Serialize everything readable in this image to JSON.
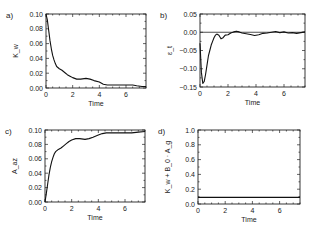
{
  "chart_data": [
    {
      "type": "line",
      "panel_label": "a)",
      "ylabel": "K_w",
      "xlabel": "Time",
      "xlim": [
        0,
        7.5
      ],
      "ylim": [
        0,
        0.1
      ],
      "xticks": [
        0,
        2,
        4,
        6
      ],
      "yticks": [
        0.0,
        0.02,
        0.04,
        0.06,
        0.08,
        0.1
      ],
      "ytick_labels": [
        "0.00",
        "0.02",
        "0.04",
        "0.06",
        "0.08",
        "0.10"
      ],
      "frame": {
        "x": 46,
        "y": 14,
        "w": 100,
        "h": 74
      },
      "series": [
        {
          "name": "K_w",
          "x": [
            0,
            0.1,
            0.2,
            0.3,
            0.4,
            0.5,
            0.6,
            0.7,
            0.8,
            1.0,
            1.2,
            1.4,
            1.6,
            1.8,
            2.0,
            2.3,
            2.6,
            3.0,
            3.3,
            3.6,
            4.0,
            4.3,
            4.6,
            5.0,
            5.5,
            6.0,
            6.5,
            6.8,
            7.2,
            7.5
          ],
          "y": [
            0.1,
            0.092,
            0.078,
            0.064,
            0.053,
            0.044,
            0.038,
            0.033,
            0.029,
            0.026,
            0.024,
            0.021,
            0.018,
            0.016,
            0.014,
            0.012,
            0.012,
            0.013,
            0.012,
            0.01,
            0.008,
            0.005,
            0.004,
            0.004,
            0.004,
            0.004,
            0.004,
            0.003,
            0.002,
            0.002
          ]
        }
      ]
    },
    {
      "type": "line",
      "panel_label": "b)",
      "ylabel": "ε_t",
      "xlabel": "Time",
      "xlim": [
        0,
        7.5
      ],
      "ylim": [
        -0.15,
        0.05
      ],
      "xticks": [
        0,
        2,
        4,
        6
      ],
      "yticks": [
        -0.15,
        -0.1,
        -0.05,
        0.0,
        0.05
      ],
      "ytick_labels": [
        "-0.15",
        "-0.10",
        "-0.05",
        "0.00",
        "0.05"
      ],
      "hline": 0.0,
      "frame": {
        "x": 200,
        "y": 14,
        "w": 105,
        "h": 73
      },
      "series": [
        {
          "name": "epsilon_t",
          "x": [
            0,
            0.1,
            0.2,
            0.3,
            0.4,
            0.5,
            0.6,
            0.7,
            0.8,
            0.9,
            1.0,
            1.1,
            1.2,
            1.35,
            1.5,
            1.65,
            1.8,
            2.0,
            2.2,
            2.4,
            2.6,
            2.8,
            3.0,
            3.3,
            3.6,
            3.9,
            4.2,
            4.5,
            4.8,
            5.1,
            5.4,
            5.7,
            6.0,
            6.3,
            6.6,
            6.9,
            7.2,
            7.5
          ],
          "y": [
            -0.03,
            -0.11,
            -0.14,
            -0.135,
            -0.115,
            -0.09,
            -0.065,
            -0.05,
            -0.035,
            -0.025,
            -0.015,
            -0.008,
            -0.005,
            -0.008,
            -0.018,
            -0.015,
            -0.008,
            -0.007,
            -0.002,
            0.001,
            0.003,
            0.001,
            -0.002,
            -0.004,
            -0.006,
            -0.009,
            -0.007,
            -0.003,
            -0.002,
            0.0,
            0.002,
            -0.001,
            0.001,
            -0.002,
            -0.001,
            -0.003,
            -0.001,
            0.001
          ]
        }
      ]
    },
    {
      "type": "line",
      "panel_label": "c)",
      "ylabel": "A_az",
      "xlabel": "Time",
      "xlim": [
        0,
        7.5
      ],
      "ylim": [
        0,
        0.1
      ],
      "xticks": [
        0,
        2,
        4,
        6
      ],
      "yticks": [
        0.0,
        0.02,
        0.04,
        0.06,
        0.08,
        0.1
      ],
      "ytick_labels": [
        "0.00",
        "0.02",
        "0.04",
        "0.06",
        "0.08",
        "0.10"
      ],
      "frame": {
        "x": 45,
        "y": 130,
        "w": 100,
        "h": 72
      },
      "series": [
        {
          "name": "A_az",
          "x": [
            0,
            0.1,
            0.2,
            0.3,
            0.4,
            0.5,
            0.6,
            0.7,
            0.8,
            1.0,
            1.2,
            1.4,
            1.6,
            1.8,
            2.0,
            2.3,
            2.6,
            3.0,
            3.3,
            3.6,
            4.0,
            4.3,
            4.6,
            5.0,
            5.5,
            6.0,
            6.5,
            7.0,
            7.5
          ],
          "y": [
            0.0,
            0.012,
            0.025,
            0.038,
            0.048,
            0.056,
            0.062,
            0.067,
            0.07,
            0.073,
            0.075,
            0.078,
            0.081,
            0.084,
            0.086,
            0.088,
            0.088,
            0.087,
            0.088,
            0.09,
            0.093,
            0.095,
            0.096,
            0.096,
            0.096,
            0.096,
            0.096,
            0.097,
            0.098
          ]
        }
      ]
    },
    {
      "type": "line",
      "panel_label": "d)",
      "ylabel": "K_w + B_0 · A_g",
      "xlabel": "Time",
      "xlim": [
        0,
        7.5
      ],
      "ylim": [
        0,
        1.0
      ],
      "xticks": [
        0,
        2,
        4,
        6
      ],
      "yticks": [
        0.0,
        0.2,
        0.4,
        0.6,
        0.8,
        1.0
      ],
      "ytick_labels": [
        "0.0",
        "0.2",
        "0.4",
        "0.6",
        "0.8",
        "1.0"
      ],
      "frame": {
        "x": 198,
        "y": 130,
        "w": 102,
        "h": 74
      },
      "series": [
        {
          "name": "K_w + B_0 A_g",
          "x": [
            0,
            7.5
          ],
          "y": [
            0.09,
            0.09
          ]
        }
      ]
    }
  ]
}
